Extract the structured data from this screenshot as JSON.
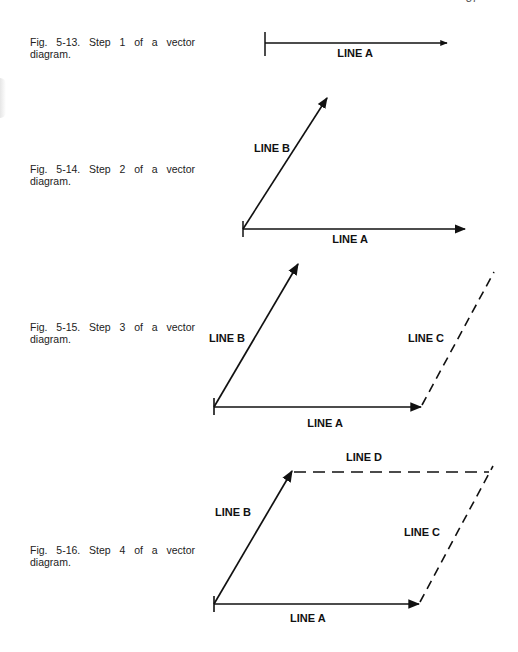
{
  "page": {
    "number": "37"
  },
  "figures": [
    {
      "id": "5-13",
      "caption_line1": "Fig. 5-13. Step 1 of a vector",
      "caption_line2": "diagram.",
      "labels": {
        "line_a": "LINE A"
      }
    },
    {
      "id": "5-14",
      "caption_line1": "Fig. 5-14. Step 2 of a vector",
      "caption_line2": "diagram.",
      "labels": {
        "line_a": "LINE A",
        "line_b": "LINE B"
      }
    },
    {
      "id": "5-15",
      "caption_line1": "Fig. 5-15. Step 3 of a vector",
      "caption_line2": "diagram.",
      "labels": {
        "line_a": "LINE A",
        "line_b": "LINE B",
        "line_c": "LINE C"
      }
    },
    {
      "id": "5-16",
      "caption_line1": "Fig. 5-16. Step 4 of a vector",
      "caption_line2": "diagram.",
      "labels": {
        "line_a": "LINE A",
        "line_b": "LINE B",
        "line_c": "LINE C",
        "line_d": "LINE D"
      }
    }
  ],
  "colors": {
    "ink": "#111111",
    "paper": "#ffffff"
  }
}
